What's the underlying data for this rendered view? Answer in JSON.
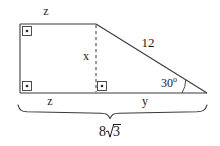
{
  "figure": {
    "type": "geometry-diagram",
    "colors": {
      "background": "#ffffff",
      "stroke": "#3a3a3a",
      "text": "#1a1a1a"
    },
    "labels": {
      "top_side": "z",
      "bottom_left_side": "z",
      "bottom_right_side": "y",
      "altitude": "x",
      "hypotenuse": "12",
      "angle_value": "30",
      "angle_degree_symbol": "o",
      "total_base_coefficient": "8",
      "total_base_radicand": "3"
    },
    "markers": {
      "right_angle_top_left": "right-angle-square-with-dot",
      "right_angle_bottom_left": "right-angle-square-with-dot",
      "right_angle_altitude_foot": "right-angle-square-with-dot",
      "angle_arc_right_vertex": "angle-arc"
    },
    "geometry": {
      "top_left": [
        20,
        24
      ],
      "apex_top_right": [
        96,
        24
      ],
      "bottom_left": [
        20,
        93
      ],
      "altitude_foot": [
        96,
        93
      ],
      "bottom_right": [
        207,
        93
      ],
      "brace_left": 18,
      "brace_right": 207,
      "brace_top": 104,
      "brace_mid_x": 110
    }
  }
}
